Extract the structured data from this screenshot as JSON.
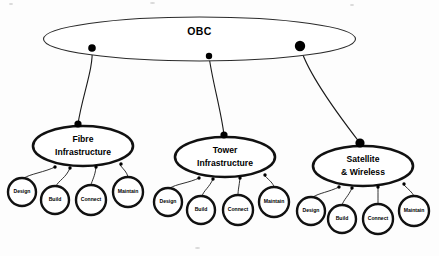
{
  "diagram": {
    "type": "tree",
    "canvas": {
      "width": 439,
      "height": 256
    },
    "root": {
      "label": "OBC",
      "shape": "ellipse",
      "cx": 199.5,
      "cy": 39,
      "rx": 156,
      "ry": 22,
      "stroke": "#2b2b2b",
      "fill": "#ffffff"
    },
    "root_connectors": [
      {
        "name": "connector-dot-fibre",
        "cx": 92,
        "cy": 48,
        "r": 3.8
      },
      {
        "name": "connector-dot-tower",
        "cx": 209,
        "cy": 56,
        "r": 3.2
      },
      {
        "name": "connector-dot-satellite",
        "cx": 300,
        "cy": 46,
        "r": 5.2
      }
    ],
    "branches": [
      {
        "id": "fibre",
        "label_lines": [
          "Fibre",
          "Infrastructure"
        ],
        "label": "Fibre Infrastructure",
        "cx": 83,
        "cy": 146,
        "rx": 50,
        "ry": 20,
        "parent_dot": {
          "cx": 78,
          "cy": 124,
          "r": 3.6
        },
        "leaves": [
          {
            "label": "Design",
            "cx": 22,
            "cy": 192,
            "r": 14
          },
          {
            "label": "Build",
            "cx": 55,
            "cy": 200,
            "r": 14
          },
          {
            "label": "Connect",
            "cx": 91,
            "cy": 200,
            "r": 15
          },
          {
            "label": "Maintain",
            "cx": 128,
            "cy": 192,
            "r": 15
          }
        ]
      },
      {
        "id": "tower",
        "label_lines": [
          "Tower",
          "Infrastructure"
        ],
        "label": "Tower Infrastructure",
        "cx": 225,
        "cy": 157,
        "rx": 50,
        "ry": 20,
        "parent_dot": {
          "cx": 224,
          "cy": 135,
          "r": 3.6
        },
        "leaves": [
          {
            "label": "Design",
            "cx": 168,
            "cy": 202,
            "r": 14
          },
          {
            "label": "Build",
            "cx": 201,
            "cy": 210,
            "r": 14
          },
          {
            "label": "Connect",
            "cx": 238,
            "cy": 210,
            "r": 15
          },
          {
            "label": "Maintain",
            "cx": 274,
            "cy": 202,
            "r": 15
          }
        ]
      },
      {
        "id": "satellite",
        "label_lines": [
          "Satellite",
          "& Wireless"
        ],
        "label": "Satellite & Wireless",
        "cx": 363,
        "cy": 166,
        "rx": 50,
        "ry": 20,
        "parent_dot": {
          "cx": 360,
          "cy": 143,
          "r": 4.6
        },
        "leaves": [
          {
            "label": "Design",
            "cx": 311,
            "cy": 211,
            "r": 14
          },
          {
            "label": "Build",
            "cx": 342,
            "cy": 219,
            "r": 14
          },
          {
            "label": "Connect",
            "cx": 378,
            "cy": 219,
            "r": 15
          },
          {
            "label": "Maintain",
            "cx": 414,
            "cy": 211,
            "r": 15
          }
        ]
      }
    ]
  }
}
